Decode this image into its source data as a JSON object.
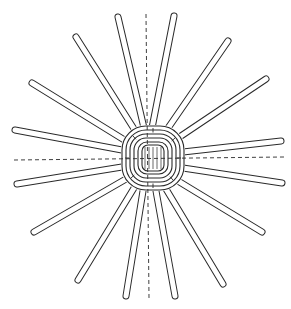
{
  "figure": {
    "stroke_color": "#2a2a2a",
    "background": "#ffffff",
    "caption": ""
  },
  "spokes": [
    {
      "x1": 118,
      "y1": 17,
      "x2": 144,
      "y2": 128
    },
    {
      "x1": 174,
      "y1": 16,
      "x2": 152,
      "y2": 128
    },
    {
      "x1": 76,
      "y1": 37,
      "x2": 136,
      "y2": 132
    },
    {
      "x1": 228,
      "y1": 41,
      "x2": 166,
      "y2": 131
    },
    {
      "x1": 32,
      "y1": 83,
      "x2": 126,
      "y2": 141
    },
    {
      "x1": 266,
      "y1": 79,
      "x2": 178,
      "y2": 138
    },
    {
      "x1": 15,
      "y1": 130,
      "x2": 122,
      "y2": 150
    },
    {
      "x1": 281,
      "y1": 141,
      "x2": 183,
      "y2": 152
    },
    {
      "x1": 17,
      "y1": 184,
      "x2": 122,
      "y2": 167
    },
    {
      "x1": 282,
      "y1": 183,
      "x2": 183,
      "y2": 168
    },
    {
      "x1": 34,
      "y1": 232,
      "x2": 126,
      "y2": 179
    },
    {
      "x1": 262,
      "y1": 232,
      "x2": 178,
      "y2": 181
    },
    {
      "x1": 78,
      "y1": 280,
      "x2": 134,
      "y2": 188
    },
    {
      "x1": 223,
      "y1": 284,
      "x2": 166,
      "y2": 189
    },
    {
      "x1": 126,
      "y1": 296,
      "x2": 143,
      "y2": 191
    },
    {
      "x1": 175,
      "y1": 296,
      "x2": 156,
      "y2": 191
    }
  ],
  "axes": {
    "vertical": {
      "x1": 146,
      "y1": 14,
      "x2": 149,
      "y2": 298
    },
    "horizontal": {
      "x1": 14,
      "y1": 160,
      "x2": 284,
      "y2": 157
    }
  },
  "center": {
    "cx": 153,
    "cy": 158,
    "rings": [
      {
        "w": 62,
        "h": 64,
        "r": 24
      },
      {
        "w": 54,
        "h": 56,
        "r": 20
      },
      {
        "w": 46,
        "h": 48,
        "r": 16
      },
      {
        "w": 38,
        "h": 40,
        "r": 12
      },
      {
        "w": 30,
        "h": 32,
        "r": 9
      },
      {
        "w": 22,
        "h": 26,
        "r": 6
      }
    ]
  }
}
